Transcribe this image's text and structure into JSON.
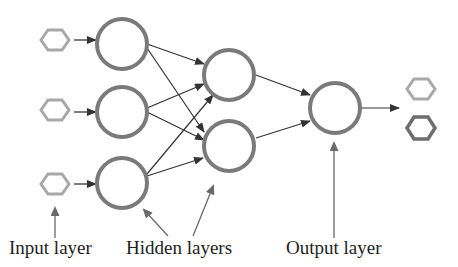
{
  "colors": {
    "node_stroke": "#7a7a7a",
    "edge": "#333333",
    "hex_light": "#a8a8a8",
    "hex_dark": "#6e6e6e",
    "pointer_arrow": "#6a6a6a",
    "text": "#1e1e1e"
  },
  "labels": {
    "input": "Input layer",
    "hidden": "Hidden layers",
    "output": "Output layer"
  },
  "network": {
    "input_nodes": 3,
    "hidden_layers": [
      3,
      2
    ],
    "output_nodes": 1,
    "output_values": 2
  }
}
